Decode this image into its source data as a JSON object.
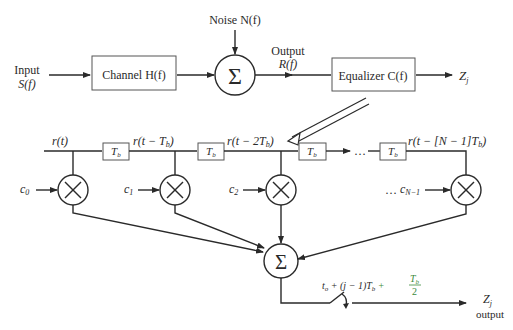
{
  "top_chain": {
    "input_label": "Input",
    "input_signal": "S(f)",
    "channel_label": "Channel H(f)",
    "noise_label": "Noise N(f)",
    "sum_symbol": "Σ",
    "output_label": "Output",
    "output_signal": "R(f)",
    "equalizer_label": "Equalizer C(f)",
    "result_label": "Z",
    "result_sub": "j"
  },
  "tapped_delay_line": {
    "taps": [
      {
        "signal": "r(t)",
        "coef": "c",
        "coef_sub": "0"
      },
      {
        "signal": "r(t − T",
        "signal_sub": "b",
        "signal_end": ")",
        "coef": "c",
        "coef_sub": "1"
      },
      {
        "signal": "r(t − 2T",
        "signal_sub": "b",
        "signal_end": ")",
        "coef": "c",
        "coef_sub": "2"
      },
      {
        "signal": "r(t − [N − 1]T",
        "signal_sub": "b",
        "signal_end": ")",
        "coef": "c",
        "coef_sub": "N−1"
      }
    ],
    "delay_label": "T",
    "delay_sub": "b",
    "ellipsis": "…",
    "multiply_symbol": "×",
    "sum_symbol": "Σ",
    "sample_time_main": "t",
    "sample_time_sub": "o",
    "sample_time_mid": " + (j − 1)T",
    "sample_time_mid_sub": "b",
    "sample_time_plus": " + ",
    "sample_frac_num": "T",
    "sample_frac_num_sub": "b",
    "sample_frac_den": "2",
    "output_Z": "Z",
    "output_Z_sub": "j",
    "output_word": "output"
  }
}
